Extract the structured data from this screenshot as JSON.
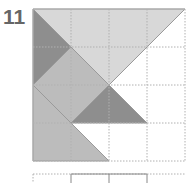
{
  "puzzle": {
    "number": "11",
    "grid": {
      "cols": 4,
      "rows": 4,
      "origin_x": 33,
      "origin_y": 9,
      "cell": 38
    },
    "colors": {
      "light": "#d8d8d8",
      "mid": "#bcbcbc",
      "dark": "#8e8e8e",
      "grid_line": "#b0b0b0",
      "edge": "#9a9a9a"
    },
    "pieces": [
      {
        "name": "top-large-triangle",
        "shade": "light",
        "points": [
          [
            0,
            0
          ],
          [
            4,
            0
          ],
          [
            2,
            2
          ]
        ]
      },
      {
        "name": "left-dark-triangle",
        "shade": "dark",
        "points": [
          [
            0,
            0
          ],
          [
            1,
            1
          ],
          [
            0,
            2
          ]
        ]
      },
      {
        "name": "center-diamond",
        "shade": "mid",
        "points": [
          [
            1,
            1
          ],
          [
            2,
            2
          ],
          [
            1,
            3
          ],
          [
            0,
            2
          ]
        ]
      },
      {
        "name": "lower-dark-triangle",
        "shade": "dark",
        "points": [
          [
            2,
            2
          ],
          [
            3,
            3
          ],
          [
            1,
            3
          ]
        ]
      },
      {
        "name": "bottom-left-trapezoid",
        "shade": "mid",
        "points": [
          [
            0,
            2
          ],
          [
            1,
            3
          ],
          [
            2,
            4
          ],
          [
            0,
            4
          ]
        ]
      }
    ],
    "next_puzzle_preview": {
      "solid_box_cols": [
        1,
        3
      ]
    }
  }
}
